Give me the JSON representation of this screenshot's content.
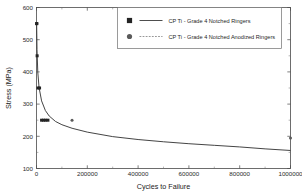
{
  "chart_data": {
    "type": "line",
    "title": "",
    "xlabel": "Cycles to Failure",
    "ylabel": "Stress (MPa)",
    "xlim": [
      0,
      1000000
    ],
    "ylim": [
      100,
      600
    ],
    "xticks": [
      "0",
      "200000",
      "400000",
      "600000",
      "800000",
      "1000000"
    ],
    "xtick_values": [
      0,
      200000,
      400000,
      600000,
      800000,
      1000000
    ],
    "yticks": [
      "100",
      "200",
      "300",
      "400",
      "500",
      "600"
    ],
    "ytick_values": [
      100,
      200,
      300,
      400,
      500,
      600
    ],
    "grid": false,
    "legend_position": "top-right",
    "legend": [
      "CP Ti - Grade 4 Notched Ringers",
      "CP Ti - Grade 4 Notched Anodized Ringers"
    ],
    "series": [
      {
        "name": "CP Ti - Grade 4 Notched Ringers",
        "marker": "filled-square",
        "line": "solid",
        "x": [
          500,
          1200,
          2500,
          6000,
          12000,
          20000,
          28000,
          36000,
          45000
        ],
        "y": [
          550,
          550,
          450,
          350,
          350,
          250,
          250,
          250,
          250
        ]
      },
      {
        "name": "CP Ti - Grade 4 Notched Anodized Ringers",
        "marker": "filled-circle",
        "line": "dashed",
        "x": [
          140000,
          1000000
        ],
        "y": [
          250,
          195
        ]
      }
    ],
    "fit_curve": {
      "name": "S-N decay fit",
      "x": [
        500,
        2000,
        5000,
        10000,
        20000,
        35000,
        50000,
        75000,
        100000,
        140000,
        200000,
        300000,
        400000,
        500000,
        600000,
        700000,
        800000,
        900000,
        1000000
      ],
      "y": [
        552,
        470,
        400,
        352,
        310,
        280,
        263,
        246,
        236,
        225,
        213,
        199,
        190,
        183,
        177,
        172,
        167,
        161,
        156
      ]
    }
  }
}
